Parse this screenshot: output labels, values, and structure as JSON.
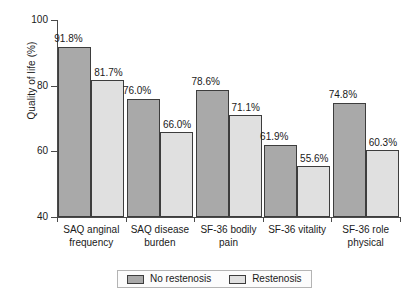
{
  "chart_data": {
    "type": "bar",
    "title": "",
    "xlabel": "",
    "ylabel": "Quality of life (%)",
    "ylim": [
      40,
      100
    ],
    "yticks": [
      40,
      60,
      80,
      100
    ],
    "grid": false,
    "legend_position": "bottom",
    "categories": [
      "SAQ anginal frequency",
      "SAQ disease burden",
      "SF-36 bodily pain",
      "SF-36 vitality",
      "SF-36 role physical"
    ],
    "category_lines": [
      [
        "SAQ anginal",
        "frequency"
      ],
      [
        "SAQ disease",
        "burden"
      ],
      [
        "SF-36 bodily",
        "pain"
      ],
      [
        "SF-36 vitality",
        ""
      ],
      [
        "SF-36 role",
        "physical"
      ]
    ],
    "series": [
      {
        "name": "No restenosis",
        "color": "#a9a9a9",
        "values": [
          91.8,
          76.0,
          78.6,
          61.9,
          74.8
        ],
        "labels": [
          "91.8%",
          "76.0%",
          "78.6%",
          "61.9%",
          "74.8%"
        ]
      },
      {
        "name": "Restenosis",
        "color": "#e0e0e0",
        "values": [
          81.7,
          66.0,
          71.1,
          55.6,
          60.3
        ],
        "labels": [
          "81.7%",
          "66.0%",
          "71.1%",
          "55.6%",
          "60.3%"
        ]
      }
    ]
  },
  "axis": {
    "y_tick_labels": [
      "40",
      "60",
      "80",
      "100"
    ],
    "y_title": "Quality of life (%)"
  },
  "legend": {
    "items": [
      {
        "label": "No restenosis",
        "swatch": "legend-swatch-no-restenosis"
      },
      {
        "label": "Restenosis",
        "swatch": "legend-swatch-restenosis"
      }
    ]
  }
}
